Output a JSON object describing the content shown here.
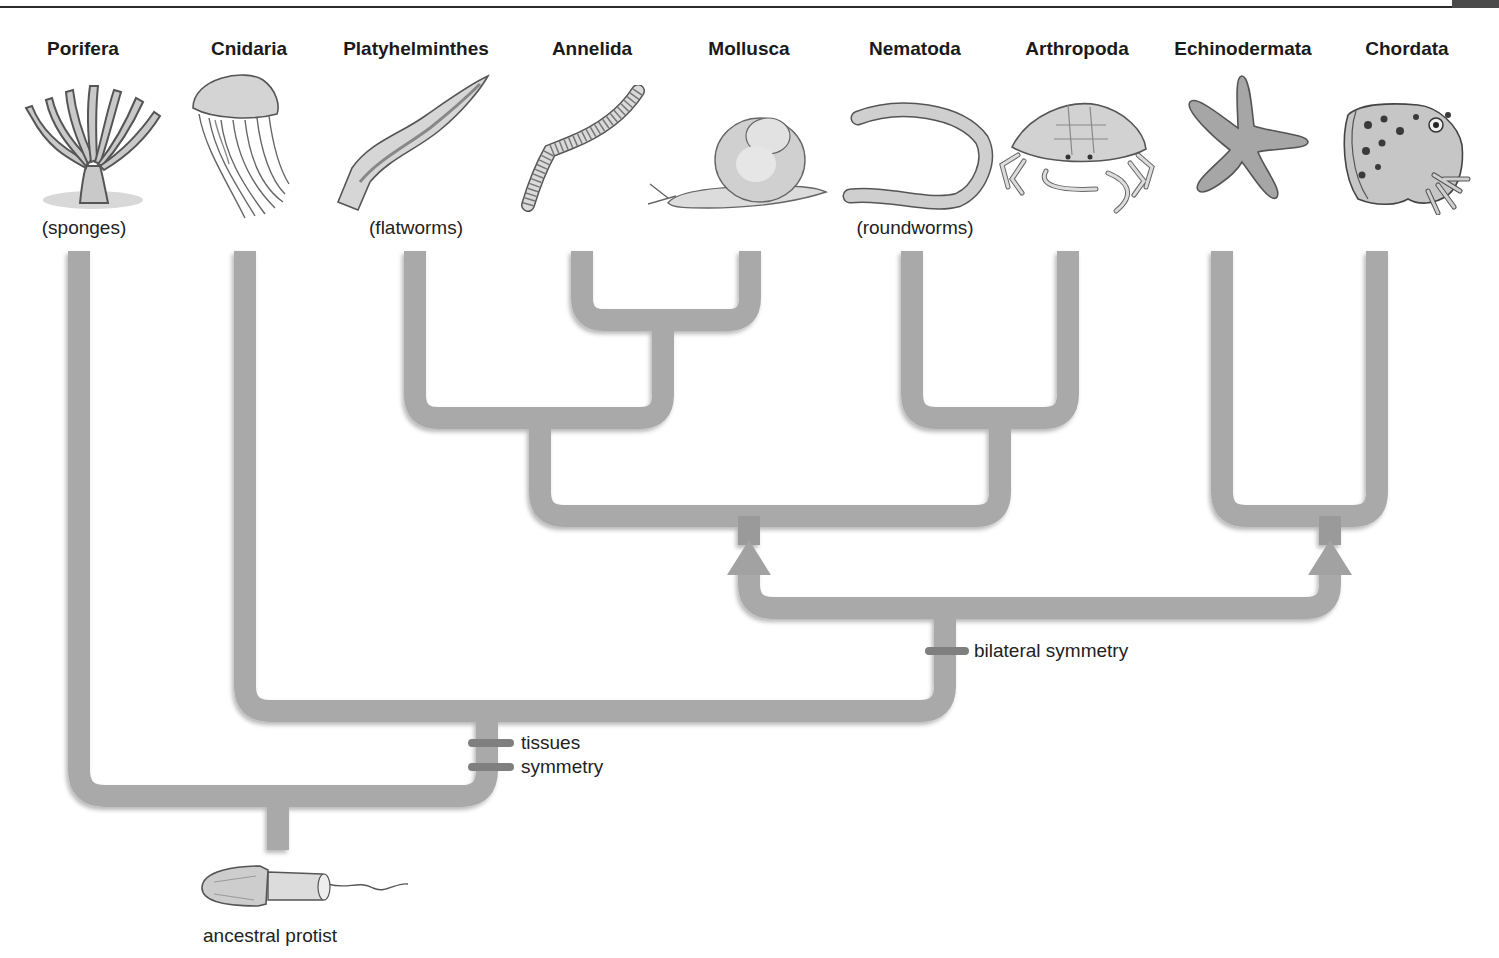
{
  "diagram": {
    "phyla": [
      {
        "name": "Porifera",
        "common": "(sponges)",
        "icon": "sponge-icon",
        "x": 83
      },
      {
        "name": "Cnidaria",
        "common": "",
        "icon": "jellyfish-icon",
        "x": 249
      },
      {
        "name": "Platyhelminthes",
        "common": "(flatworms)",
        "icon": "flatworm-icon",
        "x": 416
      },
      {
        "name": "Annelida",
        "common": "",
        "icon": "segmented-worm-icon",
        "x": 592
      },
      {
        "name": "Mollusca",
        "common": "",
        "icon": "snail-icon",
        "x": 749
      },
      {
        "name": "Nematoda",
        "common": "(roundworms)",
        "icon": "roundworm-icon",
        "x": 915
      },
      {
        "name": "Arthropoda",
        "common": "",
        "icon": "crab-icon",
        "x": 1077
      },
      {
        "name": "Echinodermata",
        "common": "",
        "icon": "starfish-icon",
        "x": 1243
      },
      {
        "name": "Chordata",
        "common": "",
        "icon": "frog-icon",
        "x": 1407
      }
    ],
    "traits": {
      "tissues": "tissues",
      "symmetry": "symmetry",
      "bilateral": "bilateral symmetry"
    },
    "root": {
      "label": "ancestral protist",
      "icon": "protist-icon"
    },
    "colors": {
      "branch": "#a9a9a9",
      "branch_shadow": "#8e8e8e",
      "trait_mark": "#7f7f7f",
      "text": "#1a1a1a"
    }
  }
}
